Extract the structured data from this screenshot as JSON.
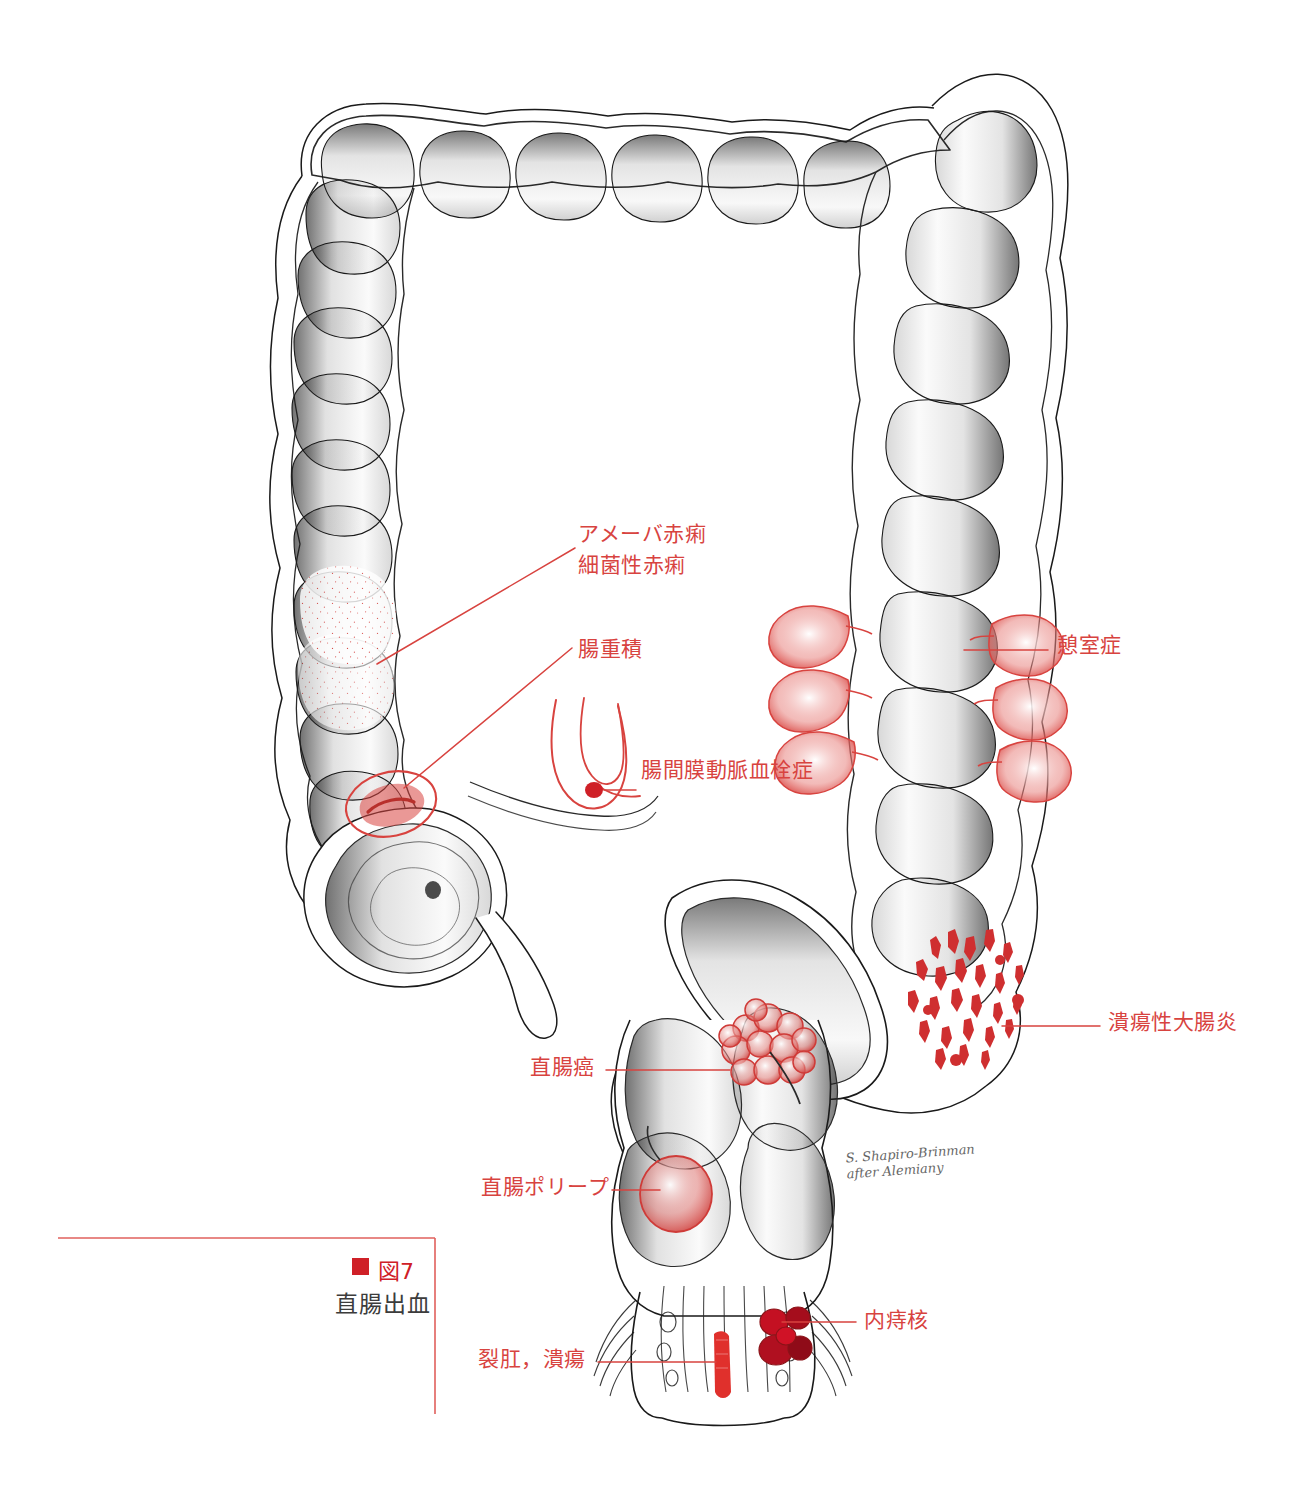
{
  "figure": {
    "caption_marker": "■",
    "caption_number": "図7",
    "caption_title": "直腸出血",
    "signature_line1": "S. Shapiro-Brinman",
    "signature_line2": "after Alemiany",
    "accent_color": "#d8433f",
    "caption_red": "#cf2027",
    "ink_color": "#1a1a1a",
    "background": "#ffffff"
  },
  "labels": {
    "amoebic_dysentery": "アメーバ赤痢",
    "bacillary_dysentery": "細菌性赤痢",
    "intussusception": "腸重積",
    "mesenteric_thrombosis": "腸間膜動脈血栓症",
    "diverticulosis": "憩室症",
    "ulcerative_colitis": "潰瘍性大腸炎",
    "rectal_cancer": "直腸癌",
    "rectal_polyp": "直腸ポリープ",
    "internal_hemorrhoids": "内痔核",
    "anal_fissure_ulcer": "裂肛，潰瘍"
  },
  "anatomy": {
    "organ": "large-intestine",
    "parts": [
      "ascending-colon",
      "transverse-colon",
      "descending-colon",
      "sigmoid-colon",
      "rectum",
      "anal-canal",
      "cecum",
      "appendix"
    ]
  }
}
